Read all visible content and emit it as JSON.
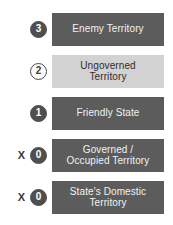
{
  "diagram": {
    "type": "legend",
    "title": "",
    "colors": {
      "dark_bar": "#5c5c5c",
      "light_bar": "#d2d2d2",
      "badge_filled": "#4f4f4f",
      "badge_outline": "#4a4a4a",
      "dark_text": "#2e2e2e",
      "light_text": "#f2f2f2"
    },
    "rows": [
      {
        "badge_value": "3",
        "badge_style": "filled",
        "prefix": "X",
        "prefix_visible": false,
        "label": "Enemy Territory",
        "bar_style": "dark"
      },
      {
        "badge_value": "2",
        "badge_style": "outlined",
        "prefix": "X",
        "prefix_visible": false,
        "label": "Ungoverned\nTerritory",
        "bar_style": "light"
      },
      {
        "badge_value": "1",
        "badge_style": "filled",
        "prefix": "X",
        "prefix_visible": false,
        "label": "Friendly State",
        "bar_style": "dark"
      },
      {
        "badge_value": "0",
        "badge_style": "filled",
        "prefix": "X",
        "prefix_visible": true,
        "label": "Governed /\nOccupied Territory",
        "bar_style": "dark"
      },
      {
        "badge_value": "0",
        "badge_style": "filled",
        "prefix": "X",
        "prefix_visible": true,
        "label": "State's Domestic\nTerritory",
        "bar_style": "dark"
      }
    ]
  }
}
